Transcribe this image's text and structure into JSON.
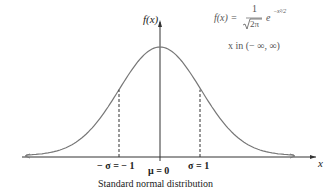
{
  "chart_data": {
    "type": "line",
    "title": "Standard normal distribution",
    "xlabel": "x",
    "ylabel": "f(x)",
    "formula": "f(x) = 1/√(2π) e^(-x²/2)",
    "domain_note": "x in (−∞, ∞)",
    "mean": 0,
    "sigma": 1,
    "annotations": [
      "−σ = −1",
      "μ = 0",
      "σ = 1"
    ],
    "x": [
      -3.5,
      -3,
      -2.5,
      -2,
      -1.5,
      -1,
      -0.5,
      0,
      0.5,
      1,
      1.5,
      2,
      2.5,
      3,
      3.5
    ],
    "y": [
      0.0009,
      0.0044,
      0.0175,
      0.054,
      0.1295,
      0.242,
      0.3521,
      0.3989,
      0.3521,
      0.242,
      0.1295,
      0.054,
      0.0175,
      0.0044,
      0.0009
    ],
    "grid": false
  },
  "labels": {
    "ylabel": "f(x)",
    "xlabel": "x",
    "formula_lhs": "f(x) =",
    "formula_num": "1",
    "formula_den": "2π",
    "formula_exp_base": "e",
    "formula_exp": "−x²/2",
    "domain": "x in (− ∞, ∞)",
    "neg_sigma": "− σ = − 1",
    "mu": "μ = 0",
    "pos_sigma": "σ = 1",
    "caption": "Standard normal distribution"
  }
}
